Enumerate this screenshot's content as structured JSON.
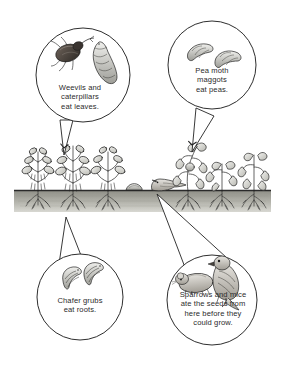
{
  "diagram": {
    "background_color": "#ffffff",
    "ink_color": "#1f1f1f",
    "soil_color": "#9a9a92"
  },
  "callouts": [
    {
      "id": "weevils",
      "position": "top-left",
      "text": "Weevils and caterpillars eat leaves.",
      "lines": [
        "Weevils and",
        "caterpillars",
        "eat leaves."
      ],
      "illustrations": [
        "weevil-beetle",
        "caterpillar"
      ],
      "points_to": "healthy-pea-plant-leaves"
    },
    {
      "id": "pea-moth",
      "position": "top-right",
      "text": "Pea moth maggots eat peas.",
      "lines": [
        "Pea moth",
        "maggots",
        "eat peas."
      ],
      "illustrations": [
        "maggot",
        "maggot"
      ],
      "points_to": "wilting-pea-plant-pods"
    },
    {
      "id": "chafer",
      "position": "bottom-left",
      "text": "Chafer grubs eat roots.",
      "lines": [
        "Chafer grubs",
        "eat roots."
      ],
      "illustrations": [
        "chafer-grub",
        "chafer-grub"
      ],
      "points_to": "plant-roots-below-soil"
    },
    {
      "id": "sparrows-mice",
      "position": "bottom-right",
      "text": "Sparrows and mice ate the seeds from here before they could grow.",
      "lines": [
        "Sparrows and mice",
        "ate the seeds from",
        "here before they",
        "could grow."
      ],
      "illustrations": [
        "mouse",
        "sparrow"
      ],
      "points_to": "bare-soil-gap-in-row"
    }
  ],
  "scene": {
    "ground_label": "soil line with roots below",
    "left_plants": 3,
    "right_plants": 3,
    "gap_items": [
      "seed-mound",
      "sparrow-on-ground"
    ]
  }
}
